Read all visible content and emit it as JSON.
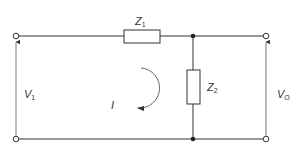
{
  "diagram": {
    "type": "circuit-schematic",
    "colors": {
      "wire": "#333333",
      "label": "#333333",
      "background": "#ffffff"
    },
    "components": {
      "z1": {
        "symbol": "Z",
        "subscript": "1",
        "kind": "series-impedance"
      },
      "z2": {
        "symbol": "Z",
        "subscript": "2",
        "kind": "shunt-impedance"
      }
    },
    "labels": {
      "input_voltage": {
        "symbol": "V",
        "subscript": "1"
      },
      "output_voltage": {
        "symbol": "V",
        "subscript": "O"
      },
      "loop_current": {
        "symbol": "I"
      }
    },
    "terminals": [
      "input-top",
      "input-bottom",
      "output-top",
      "output-bottom"
    ],
    "junctions": [
      "top-node",
      "bottom-node"
    ]
  }
}
